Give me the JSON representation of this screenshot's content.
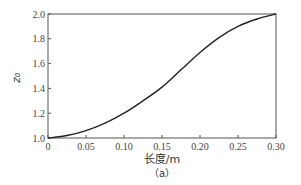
{
  "chart_data": {
    "type": "line",
    "title": "",
    "caption": "（a）",
    "xlabel": "长度/m",
    "ylabel": "z₀",
    "xlim": [
      0,
      0.3
    ],
    "ylim": [
      1.0,
      2.0
    ],
    "grid": false,
    "legend": null,
    "xticks": [
      0,
      0.05,
      0.1,
      0.15,
      0.2,
      0.25,
      0.3
    ],
    "xtick_labels": [
      "0",
      "0.05",
      "0.10",
      "0.15",
      "0.20",
      "0.25",
      "0.30"
    ],
    "yticks": [
      1.0,
      1.2,
      1.4,
      1.6,
      1.8,
      2.0
    ],
    "ytick_labels": [
      "1.0",
      "1.2",
      "1.4",
      "1.6",
      "1.8",
      "2.0"
    ],
    "series": [
      {
        "name": "z0",
        "color": "#222222",
        "x": [
          0,
          0.025,
          0.05,
          0.075,
          0.1,
          0.125,
          0.15,
          0.175,
          0.2,
          0.225,
          0.25,
          0.275,
          0.3
        ],
        "y": [
          1.0,
          1.02,
          1.06,
          1.12,
          1.2,
          1.3,
          1.41,
          1.55,
          1.69,
          1.81,
          1.9,
          1.96,
          2.0
        ]
      }
    ]
  }
}
